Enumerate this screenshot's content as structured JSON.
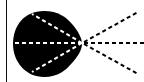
{
  "diagram": {
    "type": "geometric-figure",
    "colors": {
      "background": "#ffffff",
      "fill": "#000000",
      "inner_dash": "#ffffff",
      "outer_dash": "#000000",
      "rule": "#111111"
    },
    "vertex": [
      82,
      43
    ],
    "rays": [
      {
        "name": "upper",
        "inner_end": [
          32,
          14
        ],
        "outer_end": [
          138,
          12
        ]
      },
      {
        "name": "middle",
        "inner_end": [
          13,
          43
        ],
        "outer_end": [
          144,
          43
        ]
      },
      {
        "name": "lower",
        "inner_end": [
          32,
          72
        ],
        "outer_end": [
          138,
          74
        ]
      }
    ]
  }
}
